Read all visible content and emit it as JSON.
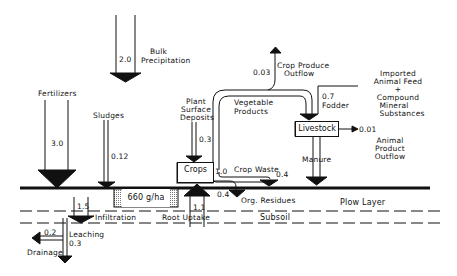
{
  "diagram": {
    "type": "nutrient-flow",
    "nodes": {
      "crops": "Crops",
      "livestock": "Livestock",
      "soil_pool": "660 g/ha"
    },
    "layers": {
      "plow_layer": "Plow Layer",
      "subsoil": "Subsoil"
    },
    "flows": {
      "bulk_precipitation": {
        "label": "Bulk\nPrecipitation",
        "label1": "Bulk",
        "label2": "Precipitation",
        "value": "2.0"
      },
      "fertilizers": {
        "label": "Fertilizers",
        "value": "3.0"
      },
      "sludges": {
        "label": "Sludges",
        "value": "0.12"
      },
      "plant_surface_deposits": {
        "label1": "Plant",
        "label2": "Surface",
        "label3": "Deposits",
        "value": "0.3"
      },
      "crop_produce_outflow": {
        "label1": "Crop Produce",
        "label2": "Outflow",
        "value": "0.03"
      },
      "vegetable_products": {
        "label1": "Vegetable",
        "label2": "Products"
      },
      "fodder": {
        "label": "Fodder",
        "value": "0.7"
      },
      "imported_feed": {
        "label1": "Imported",
        "label2": "Animal Feed",
        "label3": "+",
        "label4": "Compound",
        "label5": "Mineral",
        "label6": "Substances"
      },
      "animal_product_outflow": {
        "label1": "Animal",
        "label2": "Product",
        "label3": "Outflow",
        "value": "0.01"
      },
      "manure": {
        "label": "Manure"
      },
      "crop_waste": {
        "label": "Crop Waste",
        "value": "0.4"
      },
      "crops_out": {
        "value": "1.0"
      },
      "org_residues": {
        "label": "Org. Residues",
        "value": "0.4"
      },
      "root_uptake": {
        "label": "Root Uptake",
        "value": "1.1"
      },
      "infiltration": {
        "label": "Infiltration",
        "value": "1.5"
      },
      "leaching": {
        "label": "Leaching",
        "value": "0.3"
      },
      "drainage": {
        "label": "Drainage",
        "value": "0.2"
      }
    }
  }
}
